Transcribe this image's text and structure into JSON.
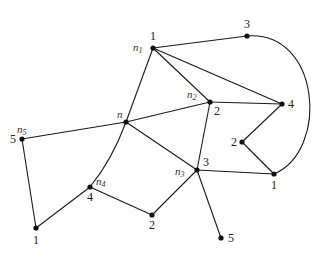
{
  "diagram": {
    "type": "weighted-graph",
    "nodes": [
      {
        "id": "n1",
        "name": "n",
        "sub": "1",
        "value": "1"
      },
      {
        "id": "top3",
        "name": "",
        "sub": "",
        "value": "3"
      },
      {
        "id": "n2",
        "name": "n",
        "sub": "2",
        "value": "2"
      },
      {
        "id": "right4",
        "name": "",
        "sub": "",
        "value": "4"
      },
      {
        "id": "n",
        "name": "n",
        "sub": "",
        "value": ""
      },
      {
        "id": "mid2",
        "name": "",
        "sub": "",
        "value": "2"
      },
      {
        "id": "n3",
        "name": "n",
        "sub": "3",
        "value": "3"
      },
      {
        "id": "right1",
        "name": "",
        "sub": "",
        "value": "1"
      },
      {
        "id": "n5",
        "name": "n",
        "sub": "5",
        "value": "5"
      },
      {
        "id": "n4",
        "name": "n",
        "sub": "4",
        "value": "4"
      },
      {
        "id": "bot2",
        "name": "",
        "sub": "",
        "value": "2"
      },
      {
        "id": "botleft1",
        "name": "",
        "sub": "",
        "value": "1"
      },
      {
        "id": "bot5",
        "name": "",
        "sub": "",
        "value": "5"
      }
    ],
    "edges": [
      [
        "n1",
        "top3"
      ],
      [
        "n1",
        "n2"
      ],
      [
        "n1",
        "right4"
      ],
      [
        "n1",
        "n"
      ],
      [
        "top3",
        "right1"
      ],
      [
        "n2",
        "right4"
      ],
      [
        "n2",
        "n"
      ],
      [
        "n2",
        "n3"
      ],
      [
        "right4",
        "mid2"
      ],
      [
        "mid2",
        "right1"
      ],
      [
        "n",
        "n5"
      ],
      [
        "n",
        "n3"
      ],
      [
        "n",
        "n4"
      ],
      [
        "n3",
        "right1"
      ],
      [
        "n3",
        "bot2"
      ],
      [
        "n3",
        "bot5"
      ],
      [
        "n5",
        "botleft1"
      ],
      [
        "botleft1",
        "n4"
      ],
      [
        "n4",
        "bot2"
      ]
    ]
  }
}
